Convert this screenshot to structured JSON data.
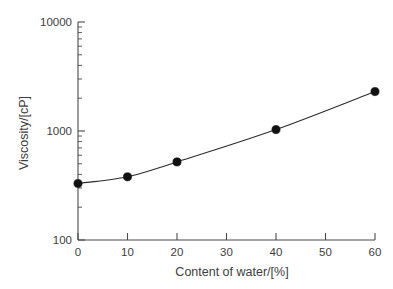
{
  "chart_data": {
    "type": "line",
    "title": "",
    "xlabel": "Content of water/[%]",
    "ylabel": "Viscosity/[cP]",
    "xlim": [
      0,
      60
    ],
    "ylim": [
      100,
      10000
    ],
    "yscale": "log",
    "xscale": "linear",
    "grid": false,
    "legend": null,
    "xticks": [
      0,
      10,
      20,
      30,
      40,
      50,
      60
    ],
    "xticklabels": [
      "0",
      "10",
      "20",
      "30",
      "40",
      "50",
      "60"
    ],
    "yticks": [
      100,
      1000,
      10000
    ],
    "yticklabels": [
      "100",
      "1000",
      "10000"
    ],
    "x": [
      0,
      10,
      20,
      40,
      60
    ],
    "values": [
      330,
      380,
      520,
      1030,
      2300
    ],
    "series": [
      {
        "name": "Viscosity",
        "marker": "filled-circle",
        "color": "#111111",
        "points": [
          {
            "x": 0,
            "y": 330
          },
          {
            "x": 10,
            "y": 380
          },
          {
            "x": 20,
            "y": 520
          },
          {
            "x": 40,
            "y": 1030
          },
          {
            "x": 60,
            "y": 2300
          }
        ]
      }
    ]
  },
  "axes": {
    "x_title": "Content of water/[%]",
    "y_title": "Viscosity/[cP]",
    "x_tick_labels": [
      "0",
      "10",
      "20",
      "30",
      "40",
      "50",
      "60"
    ],
    "y_tick_labels": [
      "10000",
      "1000",
      "100"
    ]
  },
  "colors": {
    "background": "#ffffff",
    "axis": "#4a4a4a",
    "marker": "#111111",
    "line": "#2b2b2b",
    "text": "#3d3d3d"
  }
}
